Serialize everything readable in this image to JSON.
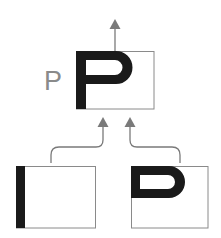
{
  "diagram": {
    "label": "P",
    "nodes": [
      {
        "id": "top",
        "shape": "P-glyph",
        "description": "Combined result: letter P"
      },
      {
        "id": "bottom-left",
        "shape": "vertical-bar",
        "description": "Vertical stroke"
      },
      {
        "id": "bottom-right",
        "shape": "D-bowl",
        "description": "Bowl shape"
      }
    ],
    "edges": [
      {
        "from": "bottom-left",
        "to": "top"
      },
      {
        "from": "bottom-right",
        "to": "top"
      },
      {
        "from": "top",
        "to": "output"
      }
    ],
    "colors": {
      "stroke": "#1a1a1a",
      "box_border": "#8a8a8a",
      "arrow": "#7a7a7a",
      "label": "#8a8a8a"
    }
  }
}
